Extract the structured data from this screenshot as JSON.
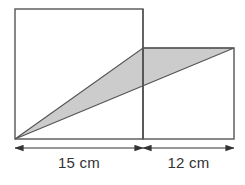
{
  "figure": {
    "background_color": "#ffffff",
    "stroke_color": "#555555",
    "shade_color": "#cccccc",
    "text_color": "#333333",
    "shapes": {
      "square": {
        "name": "left-square",
        "x": 15,
        "y": 9,
        "width": 128,
        "height": 130,
        "fill": "#ffffff"
      },
      "rectangle": {
        "name": "right-rectangle",
        "x": 143,
        "y": 48,
        "width": 91,
        "height": 91,
        "fill": "#ffffff"
      },
      "triangle": {
        "name": "shaded-triangle",
        "points": "15,139 143,48 234,48",
        "fill": "#cccccc"
      }
    },
    "dimensions": [
      {
        "name": "left-dimension",
        "label": "15 cm",
        "value": 15,
        "unit": "cm",
        "x_start": 15,
        "x_end": 143,
        "y": 148
      },
      {
        "name": "right-dimension",
        "label": "12 cm",
        "value": 12,
        "unit": "cm",
        "x_start": 143,
        "x_end": 234,
        "y": 148
      }
    ]
  }
}
